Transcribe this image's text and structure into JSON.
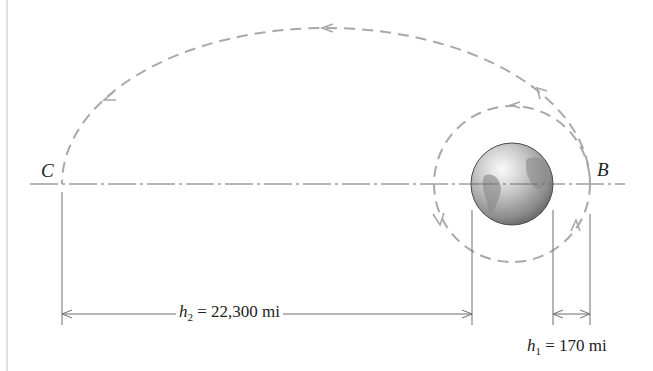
{
  "diagram": {
    "points": {
      "C": "C",
      "B": "B"
    },
    "dimensions": {
      "h2": {
        "symbol": "h",
        "subscript": "2",
        "equals": " = ",
        "value": "22,300 mi"
      },
      "h1": {
        "symbol": "h",
        "subscript": "1",
        "equals": " = ",
        "value": "170 mi"
      }
    },
    "elements": {
      "earth": "earth-globe",
      "inner_orbit": "circular-orbit",
      "transfer_orbit": "elliptical-orbit",
      "axis": "center-line"
    },
    "colors": {
      "orbit_dash": "#a8a8a8",
      "line": "#6e6e6e",
      "earth_light": "#f4f4f4",
      "earth_dark": "#5a5a5a"
    }
  }
}
